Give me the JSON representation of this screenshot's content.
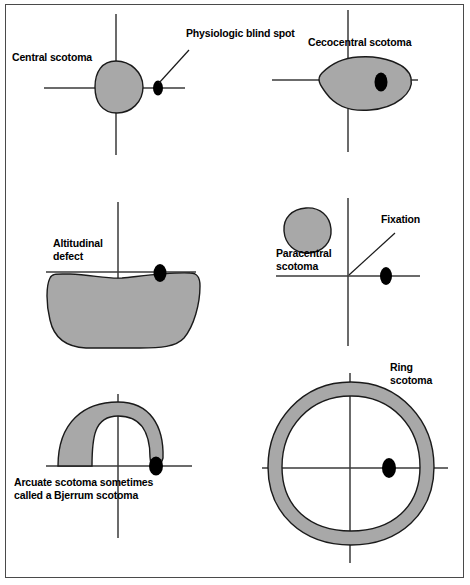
{
  "figure": {
    "background": "#ffffff",
    "border_color": "#4a4a4a",
    "scotoma_fill": "#a8a8a8",
    "scotoma_stroke": "#1a1a1a",
    "axis_color": "#3a3a3a",
    "blind_spot_color": "#000000"
  },
  "panels": [
    {
      "id": "central-scotoma",
      "label": "Central scotoma",
      "defect_type": "filled-circle-at-fixation",
      "blind_spot": true,
      "annotation": "Physiologic blind spot"
    },
    {
      "id": "cecocentral-scotoma",
      "label": "Cecocentral scotoma",
      "defect_type": "horizontal-oval-fixation-to-blindspot",
      "blind_spot": true
    },
    {
      "id": "altitudinal-defect",
      "label": "Altitudinal defect",
      "label_line_2": "defect",
      "label_line_1": "Altitudinal",
      "defect_type": "inferior-half-field",
      "blind_spot": true
    },
    {
      "id": "paracentral-scotoma",
      "label_line_1": "Paracentral",
      "label_line_2": "scotoma",
      "label": "Paracentral scotoma",
      "defect_type": "small-round-upper-left",
      "blind_spot": true,
      "annotation": "Fixation"
    },
    {
      "id": "arcuate-scotoma",
      "label_line_1": "Arcuate scotoma sometimes",
      "label_line_2": "called a Bjerrum scotoma",
      "label": "Arcuate scotoma sometimes called a Bjerrum scotoma",
      "defect_type": "superior-arcuate-band-from-blindspot",
      "blind_spot": true
    },
    {
      "id": "ring-scotoma",
      "label_line_1": "Ring",
      "label_line_2": "scotoma",
      "label": "Ring scotoma",
      "defect_type": "annulus-around-fixation",
      "blind_spot": true
    }
  ]
}
